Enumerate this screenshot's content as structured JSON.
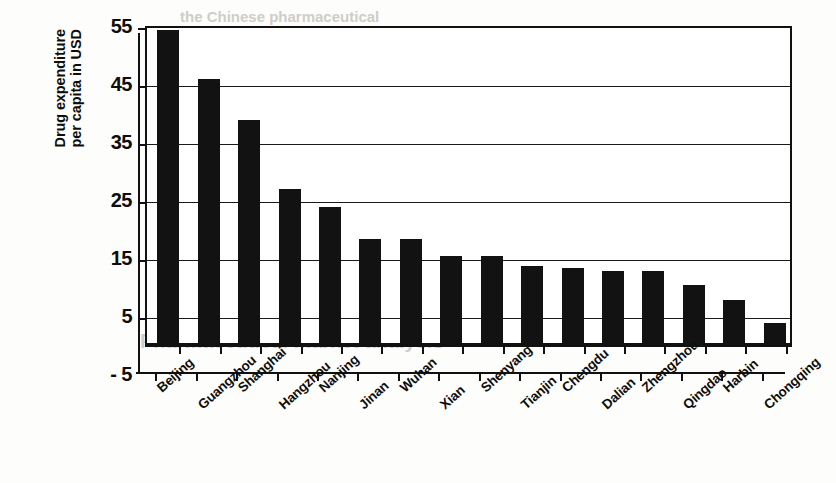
{
  "chart_data": {
    "type": "bar",
    "title": "",
    "xlabel": "",
    "ylabel_line1": "Drug expenditure",
    "ylabel_line2": "per capita in USD",
    "ylim": [
      -5,
      55
    ],
    "yticks": [
      -5,
      5,
      15,
      25,
      35,
      45,
      55
    ],
    "ytick_labels": [
      "- 5",
      "5",
      "15",
      "25",
      "35",
      "45",
      "55"
    ],
    "grid": true,
    "legend": "none",
    "orientation": "vertical",
    "bar_color": "#121212",
    "categories": [
      "Beijing",
      "Guangzhou",
      "Shanghai",
      "Hangzhou",
      "Nanjing",
      "Jinan",
      "Wuhan",
      "Xian",
      "Shenyang",
      "Tianjin",
      "Chengdu",
      "Dalian",
      "Zhengzhou",
      "Qingdao",
      "Harbin",
      "Chongqing"
    ],
    "values": [
      54,
      45.5,
      38.5,
      26.5,
      23.5,
      18,
      18,
      15,
      15,
      13.2,
      13,
      12.5,
      12.5,
      10,
      7.5,
      3.5
    ]
  },
  "background_text": {
    "lines": [
      "the Chinese pharmaceutical",
      "Opportunities for sales growth",
      "Market access for multinationals",
      "Pharmaceutical market analysis"
    ]
  }
}
